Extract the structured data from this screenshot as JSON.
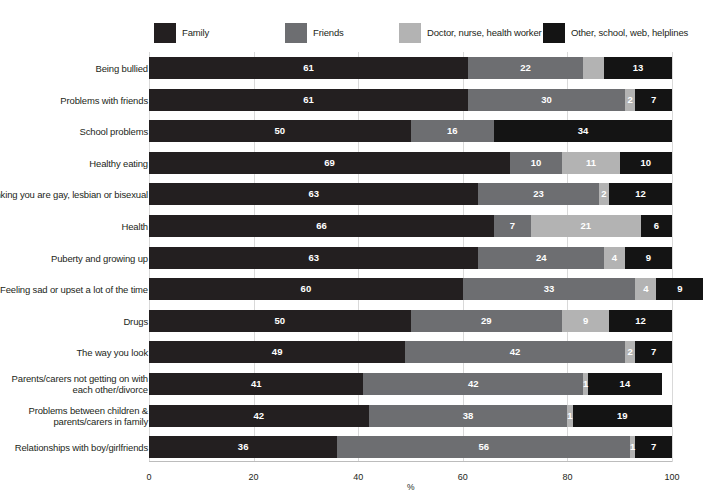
{
  "legend": {
    "items": [
      {
        "label": "Family",
        "color": "#231f20",
        "key": "family"
      },
      {
        "label": "Friends",
        "color": "#6d6e71",
        "key": "friends"
      },
      {
        "label": "Doctor, nurse, health worker",
        "color": "#b3b3b3",
        "key": "doctor"
      },
      {
        "label": "Other, school, web, helplines",
        "color": "#141414",
        "key": "other"
      }
    ]
  },
  "axis": {
    "title": "%",
    "ticks": [
      "0",
      "20",
      "40",
      "60",
      "80",
      "100"
    ],
    "min": 0,
    "max": 100
  },
  "chart_data": {
    "type": "bar",
    "orientation": "horizontal",
    "stacked": true,
    "title": "",
    "xlabel": "%",
    "ylabel": "",
    "xlim": [
      0,
      100
    ],
    "grid": true,
    "legend_position": "top",
    "categories": [
      "Being bullied",
      "Problems with friends",
      "School problems",
      "Healthy eating",
      "Thinking you are gay, lesbian or bisexual",
      "Health",
      "Puberty and growing up",
      "Feeling sad or upset a lot of the time",
      "Drugs",
      "The way you look",
      "Parents/carers not getting on with each other/divorce",
      "Problems between children & parents/carers in family",
      "Relationships with boy/girlfriends"
    ],
    "category_lines": [
      [
        "Being bullied"
      ],
      [
        "Problems with friends"
      ],
      [
        "School problems"
      ],
      [
        "Healthy eating"
      ],
      [
        "Thinking you are gay, lesbian or bisexual"
      ],
      [
        "Health"
      ],
      [
        "Puberty and growing up"
      ],
      [
        "Feeling sad or upset a lot of the time"
      ],
      [
        "Drugs"
      ],
      [
        "The way you look"
      ],
      [
        "Parents/carers not getting on with",
        "each other/divorce"
      ],
      [
        "Problems between children &",
        "parents/carers in family"
      ],
      [
        "Relationships with boy/girlfriends"
      ]
    ],
    "series": [
      {
        "name": "Family",
        "color": "#231f20",
        "values": [
          61,
          61,
          50,
          69,
          63,
          66,
          63,
          60,
          50,
          49,
          41,
          42,
          36
        ]
      },
      {
        "name": "Friends",
        "color": "#6d6e71",
        "values": [
          22,
          30,
          16,
          10,
          23,
          7,
          24,
          33,
          29,
          42,
          42,
          38,
          56
        ]
      },
      {
        "name": "Doctor, nurse, health worker",
        "color": "#b3b3b3",
        "values": [
          4,
          2,
          0,
          11,
          2,
          21,
          4,
          4,
          9,
          2,
          1,
          1,
          1
        ]
      },
      {
        "name": "Other, school, web, helplines",
        "color": "#141414",
        "values": [
          13,
          7,
          34,
          10,
          12,
          6,
          9,
          9,
          12,
          7,
          14,
          19,
          7
        ]
      }
    ],
    "labels": [
      {
        "family": "61",
        "friends": "22",
        "doctor": "",
        "other": "13"
      },
      {
        "family": "61",
        "friends": "30",
        "doctor": "2",
        "other": "7"
      },
      {
        "family": "50",
        "friends": "16",
        "doctor": "",
        "other": "34"
      },
      {
        "family": "69",
        "friends": "10",
        "doctor": "11",
        "other": "10"
      },
      {
        "family": "63",
        "friends": "23",
        "doctor": "2",
        "other": "12"
      },
      {
        "family": "66",
        "friends": "7",
        "doctor": "21",
        "other": "6"
      },
      {
        "family": "63",
        "friends": "24",
        "doctor": "4",
        "other": "9"
      },
      {
        "family": "60",
        "friends": "33",
        "doctor": "4",
        "other": "9"
      },
      {
        "family": "50",
        "friends": "29",
        "doctor": "9",
        "other": "12"
      },
      {
        "family": "49",
        "friends": "42",
        "doctor": "2",
        "other": "7"
      },
      {
        "family": "41",
        "friends": "42",
        "doctor": "1",
        "other": "14"
      },
      {
        "family": "42",
        "friends": "38",
        "doctor": "1",
        "other": "19"
      },
      {
        "family": "36",
        "friends": "56",
        "doctor": "1",
        "other": "7"
      }
    ]
  }
}
